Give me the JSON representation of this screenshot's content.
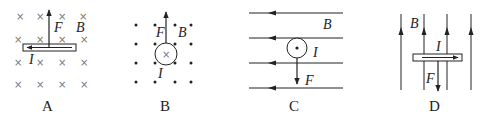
{
  "figure": {
    "panels": [
      {
        "id": "A",
        "caption": "A",
        "field": {
          "symbol": "B",
          "direction": "into page (×)"
        },
        "current": {
          "symbol": "I",
          "direction": "left"
        },
        "force": {
          "symbol": "F",
          "direction": "up"
        }
      },
      {
        "id": "B",
        "caption": "B",
        "field": {
          "symbol": "B",
          "direction": "out of page (•)"
        },
        "current": {
          "symbol": "I",
          "direction": "into page (×)"
        },
        "force": {
          "symbol": "F",
          "direction": "up"
        }
      },
      {
        "id": "C",
        "caption": "C",
        "field": {
          "symbol": "B",
          "direction": "left"
        },
        "current": {
          "symbol": "I",
          "direction": "out of page (•)"
        },
        "force": {
          "symbol": "F",
          "direction": "down"
        }
      },
      {
        "id": "D",
        "caption": "D",
        "field": {
          "symbol": "B",
          "direction": "up"
        },
        "current": {
          "symbol": "I",
          "direction": "right"
        },
        "force": {
          "symbol": "F",
          "direction": "down"
        }
      }
    ]
  }
}
